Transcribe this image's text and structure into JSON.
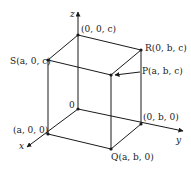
{
  "diagram": {
    "type": "3d-box-coordinates",
    "axes": {
      "x": "x",
      "y": "y",
      "z": "z"
    },
    "origin_label": "0",
    "points": {
      "top_z": "(0, 0, c)",
      "S": "S(a, 0, c)",
      "R": "R(0, b, c)",
      "P": "P(a, b, c)",
      "origin": "0",
      "a00": "(a, 0, 0)",
      "b00": "(0, b, 0)",
      "Q": "Q(a, b, 0)"
    },
    "colors": {
      "line": "#1a1a1a",
      "background": "#ffffff"
    }
  }
}
